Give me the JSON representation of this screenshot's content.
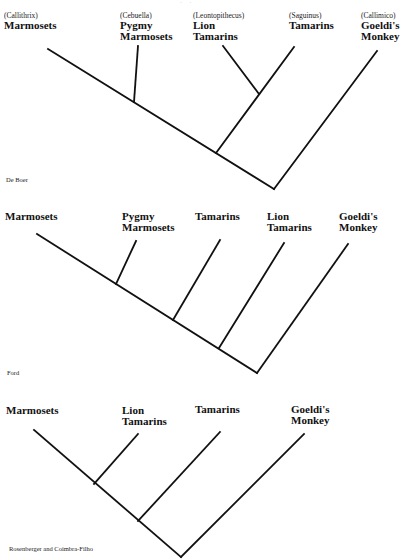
{
  "figure": {
    "stroke_color": "#111111",
    "background": "#ffffff",
    "panels": [
      {
        "attribution": "De Boer",
        "taxa": [
          {
            "genus": "(Callithrix)",
            "common": "Marmosets"
          },
          {
            "genus": "(Cebuella)",
            "common": "Pygmy Marmosets",
            "line1": "Pygmy",
            "line2": "Marmosets"
          },
          {
            "genus": "(Leontopithecus)",
            "common": "Lion Tamarins",
            "line1": "Lion",
            "line2": "Tamarins"
          },
          {
            "genus": "(Saguinus)",
            "common": "Tamarins"
          },
          {
            "genus": "(Callimico)",
            "common": "Goeldi's Monkey",
            "line1": "Goeldi's",
            "line2": "Monkey"
          }
        ],
        "topology": "((Marmosets, Pygmy Marmosets), (Lion Tamarins, Tamarins)), Goeldi's Monkey"
      },
      {
        "attribution": "Ford",
        "taxa": [
          {
            "common": "Marmosets"
          },
          {
            "common": "Pygmy Marmosets",
            "line1": "Pygmy",
            "line2": "Marmosets"
          },
          {
            "common": "Tamarins"
          },
          {
            "common": "Lion Tamarins",
            "line1": "Lion",
            "line2": "Tamarins"
          },
          {
            "common": "Goeldi's Monkey",
            "line1": "Goeldi's",
            "line2": "Monkey"
          }
        ],
        "topology": "((((Marmosets, Pygmy Marmosets), Tamarins), Lion Tamarins), Goeldi's Monkey)"
      },
      {
        "attribution": "Rosenberger and Coimbra-Filho",
        "taxa": [
          {
            "common": "Marmosets"
          },
          {
            "common": "Lion Tamarins",
            "line1": "Lion",
            "line2": "Tamarins"
          },
          {
            "common": "Tamarins"
          },
          {
            "common": "Goeldi's Monkey",
            "line1": "Goeldi's",
            "line2": "Monkey"
          }
        ],
        "topology": "(((Marmosets, Lion Tamarins), Tamarins), Goeldi's Monkey)"
      }
    ]
  }
}
